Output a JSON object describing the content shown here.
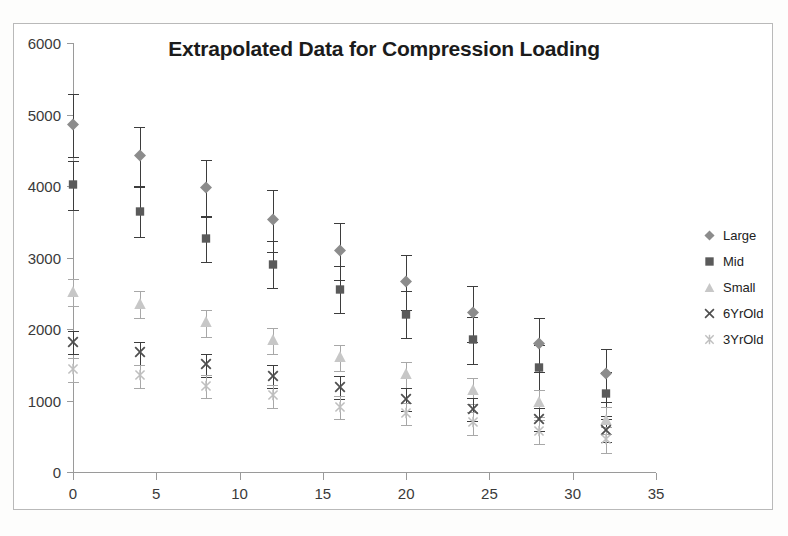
{
  "chart_data": {
    "type": "scatter",
    "title": "Extrapolated Data for Compression Loading",
    "xlabel": "",
    "ylabel": "",
    "xlim": [
      0,
      35
    ],
    "ylim": [
      0,
      6000
    ],
    "xticks": [
      0,
      5,
      10,
      15,
      20,
      25,
      30,
      35
    ],
    "yticks": [
      0,
      1000,
      2000,
      3000,
      4000,
      5000,
      6000
    ],
    "grid": false,
    "legend_position": "right",
    "x": [
      0,
      4,
      8,
      12,
      16,
      20,
      24,
      28,
      32
    ],
    "series": [
      {
        "name": "Large",
        "marker": "diamond",
        "color": "#8c8c8c",
        "values": [
          4840,
          4410,
          3960,
          3510,
          3080,
          2650,
          2210,
          1780,
          1350
        ],
        "errors": [
          440,
          410,
          400,
          440,
          400,
          380,
          390,
          380,
          370
        ]
      },
      {
        "name": "Mid",
        "marker": "square",
        "color": "#5a5a5a",
        "values": [
          4010,
          3630,
          3260,
          2900,
          2550,
          2200,
          1840,
          1460,
          1090
        ],
        "errors": [
          340,
          350,
          320,
          330,
          330,
          330,
          330,
          320,
          310
        ]
      },
      {
        "name": "Small",
        "marker": "triangle",
        "color": "#c7c7c7",
        "values": [
          2510,
          2340,
          2080,
          1830,
          1590,
          1360,
          1130,
          960,
          720
        ],
        "errors": [
          190,
          190,
          190,
          180,
          180,
          180,
          180,
          190,
          190
        ]
      },
      {
        "name": "6YrOld",
        "marker": "x",
        "color": "#4f4f4f",
        "values": [
          1810,
          1660,
          1490,
          1330,
          1180,
          1010,
          870,
          730,
          580
        ],
        "errors": [
          160,
          160,
          160,
          160,
          160,
          160,
          160,
          160,
          160
        ]
      },
      {
        "name": "3YrOld",
        "marker": "asterisk",
        "color": "#bfbfbf",
        "values": [
          1430,
          1340,
          1190,
          1060,
          900,
          810,
          680,
          560,
          450
        ],
        "errors": [
          170,
          160,
          160,
          160,
          160,
          150,
          160,
          170,
          180
        ]
      }
    ]
  },
  "legend": {
    "items": [
      {
        "label": "Large"
      },
      {
        "label": "Mid"
      },
      {
        "label": "Small"
      },
      {
        "label": "6YrOld"
      },
      {
        "label": "3YrOld"
      }
    ]
  }
}
